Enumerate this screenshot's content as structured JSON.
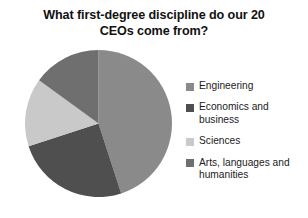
{
  "chart_data": {
    "type": "pie",
    "title": "What first-degree discipline do our 20 CEOs come from?",
    "categories": [
      "Engineering",
      "Economics and business",
      "Sciences",
      "Arts, languages and humanities"
    ],
    "values": [
      9,
      5,
      3,
      3
    ],
    "total": 20,
    "units": "CEOs",
    "percentages": [
      45,
      25,
      15,
      15
    ],
    "start_angle_deg": 0,
    "direction": "clockwise",
    "colors": [
      "#8a8a8a",
      "#4f4f4f",
      "#c9c9c9",
      "#6f6f6f"
    ],
    "legend_position": "right",
    "grid": false,
    "xlabel": "",
    "ylabel": "",
    "slices": [
      {
        "label": "Engineering",
        "value": 9,
        "percent": 45,
        "color": "#8a8a8a",
        "start_deg": 0,
        "end_deg": 162
      },
      {
        "label": "Economics and business",
        "value": 5,
        "percent": 25,
        "color": "#4f4f4f",
        "start_deg": 162,
        "end_deg": 252
      },
      {
        "label": "Sciences",
        "value": 3,
        "percent": 15,
        "color": "#c9c9c9",
        "start_deg": 252,
        "end_deg": 306
      },
      {
        "label": "Arts, languages and humanities",
        "value": 3,
        "percent": 15,
        "color": "#6f6f6f",
        "start_deg": 306,
        "end_deg": 360
      }
    ]
  },
  "title": {
    "line1": "What first-degree discipline do our 20",
    "line2": "CEOs come from?"
  },
  "legend": {
    "items": [
      {
        "label": "Engineering",
        "color": "#8a8a8a"
      },
      {
        "label": "Economics and business",
        "color": "#4f4f4f"
      },
      {
        "label": "Sciences",
        "color": "#c9c9c9"
      },
      {
        "label": "Arts, languages and humanities",
        "color": "#6f6f6f"
      }
    ]
  }
}
